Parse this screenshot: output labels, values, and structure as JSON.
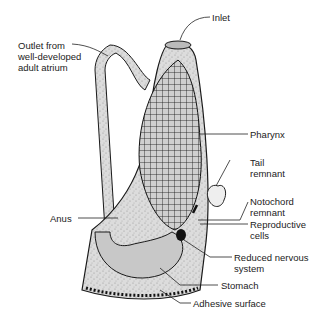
{
  "diagram": {
    "labels": {
      "inlet": "Inlet",
      "outlet": "Outlet from\nwell-developed\nadult atrium",
      "pharynx": "Pharynx",
      "tail_remnant": "Tail\nremnant",
      "notochord_remnant": "Notochord\nremnant",
      "anus": "Anus",
      "reproductive_cells": "Reproductive\ncells",
      "reduced_nervous_system": "Reduced nervous\nsystem",
      "stomach": "Stomach",
      "adhesive_surface": "Adhesive surface"
    },
    "colors": {
      "body_fill": "#d9d9d9",
      "stipple": "#9a9a9a",
      "outline": "#1a1a1a",
      "inner_fill": "#c8c8c8"
    }
  }
}
